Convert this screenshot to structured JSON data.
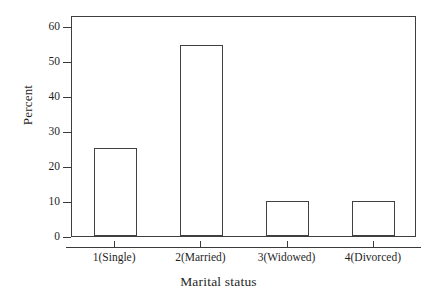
{
  "chart_data": {
    "type": "bar",
    "title": "",
    "subtitle": "",
    "xlabel": "Marital status",
    "ylabel": "Percent",
    "categories": [
      "1(Single)",
      "2(Married)",
      "3(Widowed)",
      "4(Divorced)"
    ],
    "values": [
      25,
      54.5,
      10,
      10
    ],
    "series": [
      {
        "name": "Percent",
        "values": [
          25,
          54.5,
          10,
          10
        ]
      }
    ],
    "ylim": [
      0,
      63
    ],
    "yticks": [
      0,
      10,
      20,
      30,
      40,
      50,
      60
    ],
    "ytick_labels": [
      "0",
      "10",
      "20",
      "30",
      "40",
      "50",
      "60"
    ],
    "xtick_labels": [
      "1(Single)",
      "2(Married)",
      "3(Widowed)",
      "4(Divorced)"
    ],
    "grid": false,
    "legend": null,
    "legend_position": "none",
    "bar_fill_color": "#ffffff",
    "bar_edge_color": "#404040",
    "axis_color": "#3a3a3a",
    "text_color": "#1f1f1f",
    "background_color": "#ffffff",
    "annotations": []
  },
  "axes": {
    "y_title": "Percent",
    "x_title": "Marital status"
  }
}
